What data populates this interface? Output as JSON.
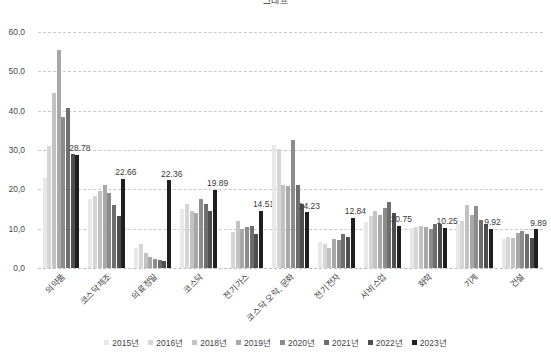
{
  "chart_title": "그래프",
  "chart_data": {
    "type": "bar",
    "title": "",
    "xlabel": "",
    "ylabel": "",
    "ylim": [
      0,
      60
    ],
    "ytick_labels": [
      "0,0",
      "10,0",
      "20,0",
      "30,0",
      "40,0",
      "50,0",
      "60,0"
    ],
    "ytick_values": [
      0,
      10,
      20,
      30,
      40,
      50,
      60
    ],
    "grid": true,
    "legend_position": "bottom",
    "categories": [
      "의약품",
      "코스닥제조",
      "의료정밀",
      "코스닥",
      "전기가스",
      "코스닥 오락, 문화",
      "전기전자",
      "서비스업",
      "화학",
      "기계",
      "건설"
    ],
    "series": [
      {
        "name": "2015년",
        "color": "#e8e8e8",
        "values": [
          23.0,
          17.6,
          5.2,
          15.1,
          0.0,
          31.2,
          6.6,
          11.6,
          10.2,
          11.3,
          7.4
        ]
      },
      {
        "name": "2016년",
        "color": "#d6d6d6",
        "values": [
          30.9,
          18.2,
          6.1,
          16.3,
          9.2,
          30.2,
          6.2,
          13.2,
          10.5,
          12.0,
          7.9
        ]
      },
      {
        "name": "2018년",
        "color": "#c2c2c2",
        "values": [
          44.4,
          19.7,
          3.9,
          14.4,
          11.9,
          21.1,
          5.0,
          14.4,
          10.6,
          16.0,
          7.6
        ]
      },
      {
        "name": "2019년",
        "color": "#a8a8a8",
        "values": [
          55.5,
          21.2,
          2.7,
          14.0,
          9.8,
          20.8,
          7.5,
          13.4,
          10.4,
          13.5,
          9.0
        ]
      },
      {
        "name": "2020년",
        "color": "#8c8c8c",
        "values": [
          38.5,
          19.0,
          2.4,
          17.6,
          10.5,
          32.6,
          7.1,
          15.3,
          10.0,
          15.8,
          9.5
        ]
      },
      {
        "name": "2021년",
        "color": "#6e6e6e",
        "values": [
          40.6,
          16.1,
          2.1,
          16.4,
          10.8,
          21.2,
          8.6,
          16.8,
          11.1,
          12.1,
          8.6
        ]
      },
      {
        "name": "2022년",
        "color": "#4e4e4e",
        "values": [
          29.0,
          13.3,
          1.8,
          14.4,
          8.7,
          16.4,
          8.0,
          13.9,
          11.1,
          11.3,
          7.6
        ]
      },
      {
        "name": "2023년",
        "color": "#1f1f1f",
        "values": [
          28.78,
          22.66,
          22.36,
          19.89,
          14.51,
          14.23,
          12.84,
          10.75,
          10.25,
          9.92,
          9.89
        ]
      }
    ],
    "data_labels": {
      "series": "2023년",
      "values": [
        "28.78",
        "22.66",
        "22.36",
        "19.89",
        "14.51",
        "14.23",
        "12.84",
        "10.75",
        "10.25",
        "9.92",
        "9.89"
      ]
    }
  }
}
